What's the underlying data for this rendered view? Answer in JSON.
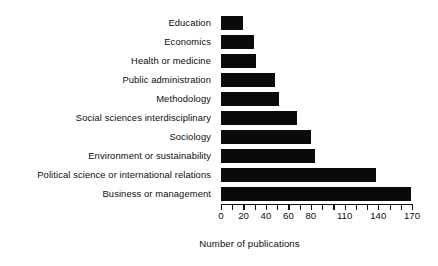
{
  "chart_data": {
    "type": "bar",
    "orientation": "horizontal",
    "title": "",
    "xlabel": "Number of publications",
    "ylabel": "",
    "categories": [
      "Education",
      "Economics",
      "Health or medicine",
      "Public administration",
      "Methodology",
      "Social sciences interdisciplinary",
      "Sociology",
      "Environment or sustainability",
      "Political science or international relations",
      "Business or management"
    ],
    "values": [
      20,
      29,
      31,
      48,
      52,
      68,
      80,
      84,
      138,
      169
    ],
    "xlim": [
      0,
      170
    ],
    "tick_values": [
      0,
      10,
      20,
      30,
      40,
      50,
      60,
      70,
      80,
      90,
      100,
      110,
      120,
      130,
      140,
      150,
      160,
      170
    ],
    "tick_labels": [
      {
        "value": 0,
        "label": "0"
      },
      {
        "value": 20,
        "label": "20"
      },
      {
        "value": 40,
        "label": "40"
      },
      {
        "value": 60,
        "label": "60"
      },
      {
        "value": 80,
        "label": "80"
      },
      {
        "value": 110,
        "label": "110"
      },
      {
        "value": 140,
        "label": "140"
      },
      {
        "value": 170,
        "label": "170"
      }
    ],
    "grid": false,
    "legend": null,
    "bar_color": "#0a0a0a",
    "background_color": "#ffffff"
  }
}
